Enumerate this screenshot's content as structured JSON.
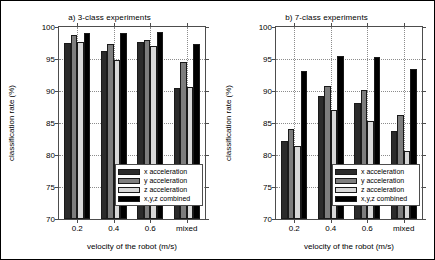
{
  "figure": {
    "background": "#ffffff",
    "axis_color": "#4d4d4d",
    "grid_color": "#8c8c8c"
  },
  "series_colors": [
    "#2b2b2b",
    "#7d7d7d",
    "#d8d8d8",
    "#000000"
  ],
  "panels": [
    {
      "id": "panel-a",
      "title": "a) 3-class experiments",
      "ylabel": "classification rate (%)",
      "xlabel": "velocity of the robot (m/s)",
      "yticks": [
        70,
        75,
        80,
        85,
        90,
        95,
        100
      ],
      "ytick_labels": [
        "70",
        "75",
        "80",
        "85",
        "90",
        "95",
        "100"
      ],
      "xtick_labels": [
        "0.2",
        "0.4",
        "0.6",
        "mixed"
      ]
    },
    {
      "id": "panel-b",
      "title": "b) 7-class experiments",
      "ylabel": "classification rate (%)",
      "xlabel": "velocity of the robot (m/s)",
      "yticks": [
        70,
        75,
        80,
        85,
        90,
        95,
        100
      ],
      "ytick_labels": [
        "70",
        "75",
        "80",
        "85",
        "90",
        "95",
        "100"
      ],
      "xtick_labels": [
        "0.2",
        "0.4",
        "0.6",
        "mixed"
      ]
    }
  ],
  "legend": {
    "items": [
      {
        "label": "x acceleration",
        "color": "#2b2b2b"
      },
      {
        "label": "y acceleration",
        "color": "#7d7d7d"
      },
      {
        "label": "z acceleration",
        "color": "#d8d8d8"
      },
      {
        "label": "x,y,z combined",
        "color": "#000000"
      }
    ]
  },
  "chart_data": [
    {
      "type": "bar",
      "title": "a) 3-class experiments",
      "xlabel": "velocity of the robot (m/s)",
      "ylabel": "classification rate (%)",
      "categories": [
        "0.2",
        "0.4",
        "0.6",
        "mixed"
      ],
      "ylim": [
        70,
        100
      ],
      "yticks": [
        70,
        75,
        80,
        85,
        90,
        95,
        100
      ],
      "grid": true,
      "legend_position": "lower-right-inside",
      "series": [
        {
          "name": "x acceleration",
          "color": "#2b2b2b",
          "values": [
            97.5,
            96.3,
            97.6,
            90.5
          ]
        },
        {
          "name": "y acceleration",
          "color": "#7d7d7d",
          "values": [
            98.7,
            97.3,
            98.0,
            94.6
          ]
        },
        {
          "name": "z acceleration",
          "color": "#d8d8d8",
          "values": [
            97.7,
            94.9,
            97.0,
            90.7
          ]
        },
        {
          "name": "x,y,z combined",
          "color": "#000000",
          "values": [
            99.1,
            99.1,
            99.2,
            97.4
          ]
        }
      ]
    },
    {
      "type": "bar",
      "title": "b) 7-class experiments",
      "xlabel": "velocity of the robot (m/s)",
      "ylabel": "classification rate (%)",
      "categories": [
        "0.2",
        "0.4",
        "0.6",
        "mixed"
      ],
      "ylim": [
        70,
        100
      ],
      "yticks": [
        70,
        75,
        80,
        85,
        90,
        95,
        100
      ],
      "grid": true,
      "legend_position": "lower-right-inside",
      "series": [
        {
          "name": "x acceleration",
          "color": "#2b2b2b",
          "values": [
            82.2,
            89.2,
            88.2,
            83.8
          ]
        },
        {
          "name": "y acceleration",
          "color": "#7d7d7d",
          "values": [
            84.0,
            90.8,
            90.2,
            86.3
          ]
        },
        {
          "name": "z acceleration",
          "color": "#d8d8d8",
          "values": [
            81.4,
            87.0,
            85.3,
            80.7
          ]
        },
        {
          "name": "x,y,z combined",
          "color": "#000000",
          "values": [
            93.1,
            95.5,
            95.3,
            93.5
          ]
        }
      ]
    }
  ]
}
